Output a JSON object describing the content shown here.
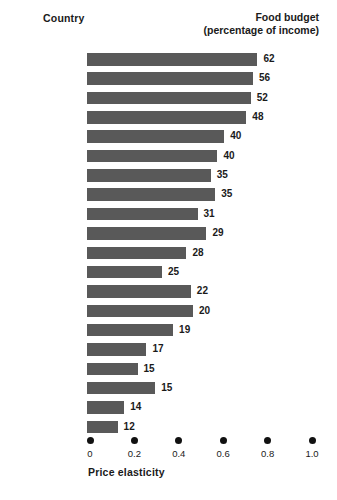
{
  "header": {
    "left_label": "Country",
    "right_label_line1": "Food budget",
    "right_label_line2": "(percentage of income)"
  },
  "axis": {
    "title": "Price elasticity",
    "ticks": [
      "0",
      "0.2",
      "0.4",
      "0.6",
      "0.8",
      "1.0"
    ],
    "tick_values": [
      0,
      0.2,
      0.4,
      0.6,
      0.8,
      1.0
    ],
    "marker_style": "dot"
  },
  "colors": {
    "bar": "#595959",
    "text": "#1a1a1a",
    "background": "#ffffff",
    "axis_dot": "#111111"
  },
  "chart_data": {
    "type": "bar",
    "orientation": "horizontal",
    "title": "",
    "subtitle": "",
    "xlabel": "Price elasticity",
    "ylabel": "Country",
    "xlim": [
      0,
      1.05
    ],
    "grid": false,
    "legend": null,
    "value_label_note": "Food budget (percentage of income)",
    "categories": [
      "Tanzania",
      "India",
      "Nigeria",
      "Indonesia",
      "Bolivia",
      "Korea",
      "Brazil",
      "Peru",
      "Greece",
      "Chile",
      "Spain",
      "Italy",
      "Israel",
      "Ireland",
      "Japan",
      "France",
      "Germany",
      "United Kingdom",
      "Canada",
      "United States"
    ],
    "series": [
      {
        "name": "Price elasticity",
        "encoded_as": "bar-length",
        "values": [
          0.77,
          0.75,
          0.74,
          0.72,
          0.62,
          0.59,
          0.56,
          0.58,
          0.5,
          0.54,
          0.45,
          0.34,
          0.47,
          0.48,
          0.39,
          0.27,
          0.23,
          0.31,
          0.17,
          0.14
        ]
      },
      {
        "name": "Food budget (percentage of income)",
        "encoded_as": "data-label",
        "values": [
          62,
          56,
          52,
          48,
          40,
          40,
          35,
          35,
          31,
          29,
          28,
          25,
          22,
          20,
          19,
          17,
          15,
          15,
          14,
          12
        ]
      }
    ]
  }
}
